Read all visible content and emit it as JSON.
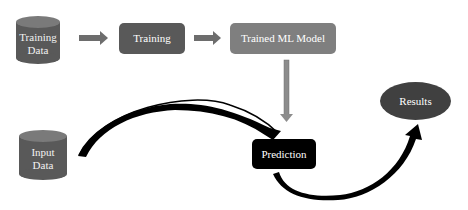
{
  "diagram": {
    "nodes": {
      "training_data": {
        "label_line1": "Training",
        "label_line2": "Data",
        "shape": "cylinder",
        "color": "#595959"
      },
      "training": {
        "label": "Training",
        "shape": "rounded-rectangle",
        "color": "#595959"
      },
      "trained_model": {
        "label": "Trained ML Model",
        "shape": "rounded-rectangle",
        "color": "#7f7f7f"
      },
      "input_data": {
        "label_line1": "Input",
        "label_line2": "Data",
        "shape": "cylinder",
        "color": "#595959"
      },
      "prediction": {
        "label": "Prediction",
        "shape": "rounded-rectangle",
        "color": "#000000"
      },
      "results": {
        "label": "Results",
        "shape": "ellipse",
        "color": "#404040"
      }
    },
    "edges": [
      {
        "from": "Training Data",
        "to": "Training",
        "style": "block-arrow"
      },
      {
        "from": "Training",
        "to": "Trained ML Model",
        "style": "block-arrow"
      },
      {
        "from": "Trained ML Model",
        "to": "Prediction",
        "style": "vertical-arrow"
      },
      {
        "from": "Input Data",
        "to": "Prediction",
        "style": "curved-arrow"
      },
      {
        "from": "Prediction",
        "to": "Results",
        "style": "curved-arrow"
      }
    ]
  }
}
